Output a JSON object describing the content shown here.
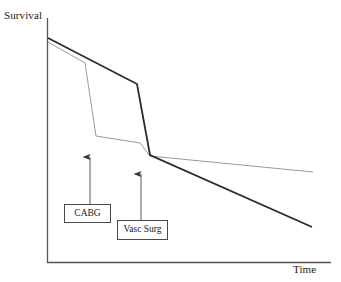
{
  "chart_data": {
    "type": "line",
    "title": "",
    "subtitle": "",
    "xlabel": "Time",
    "ylabel": "Survival",
    "grid": false,
    "legend_position": "none",
    "axis_style": "open-l-shape",
    "xlim": [
      0,
      100
    ],
    "ylim": [
      0,
      100
    ],
    "axis_ticks": {
      "x": [],
      "y": []
    },
    "annotations": [
      {
        "label": "CABG",
        "points_to_series": "cabg-strategy",
        "arrow_tip": {
          "x": 15,
          "y": 47
        },
        "arrow_tail": {
          "x": 15,
          "y": 25
        },
        "box": {
          "x": 6,
          "y": 18,
          "w": 17,
          "h": 8
        }
      },
      {
        "label": "Vasc Surg",
        "points_to_series": "vascular-surgery-strategy",
        "arrow_tip": {
          "x": 33,
          "y": 41
        },
        "arrow_tail": {
          "x": 33,
          "y": 18
        },
        "box": {
          "x": 25,
          "y": 11,
          "w": 18,
          "h": 9
        }
      }
    ],
    "series": [
      {
        "name": "vascular-surgery-strategy",
        "style": "thin-gray",
        "color": "#9a9a9a",
        "width": 1,
        "points": [
          {
            "x": 0,
            "y": 100
          },
          {
            "x": 13,
            "y": 89
          },
          {
            "x": 17,
            "y": 56
          },
          {
            "x": 36,
            "y": 53
          },
          {
            "x": 37,
            "y": 48
          },
          {
            "x": 94,
            "y": 40
          }
        ]
      },
      {
        "name": "cabg-strategy",
        "style": "thick-black",
        "color": "#2b2b2b",
        "width": 1.8,
        "points": [
          {
            "x": 0,
            "y": 100
          },
          {
            "x": 31,
            "y": 80
          },
          {
            "x": 36,
            "y": 48
          },
          {
            "x": 93,
            "y": 15
          }
        ]
      }
    ],
    "pixel_geometry": {
      "note": "Approximate pixel coordinates read from the screenshot; used for faithful redraw.",
      "axis": {
        "origin_x": 47,
        "origin_y": 262,
        "top_y": 18,
        "right_x": 331
      },
      "gray_line": [
        [
          48,
          42
        ],
        [
          85,
          63
        ],
        [
          96,
          136
        ],
        [
          140,
          143
        ],
        [
          150,
          156
        ],
        [
          313,
          172
        ]
      ],
      "black_line": [
        [
          48,
          38
        ],
        [
          137,
          84
        ],
        [
          150,
          155
        ],
        [
          312,
          227
        ]
      ],
      "cabg_arrow": {
        "x": 90,
        "tip_y": 157,
        "tail_y": 204
      },
      "vasc_arrow": {
        "x": 141,
        "tip_y": 174,
        "tail_y": 220
      }
    }
  },
  "labels": {
    "y_axis": "Survival",
    "x_axis": "Time"
  },
  "callouts": {
    "cabg": "CABG",
    "vasc_surg": "Vasc Surg"
  },
  "colors": {
    "axis": "#555555",
    "gray_curve": "#9a9a9a",
    "black_curve": "#2b2b2b",
    "arrow": "#4a4a4a",
    "box_border": "#4a4a4a",
    "background": "#ffffff",
    "text": "#1a1a1a"
  }
}
